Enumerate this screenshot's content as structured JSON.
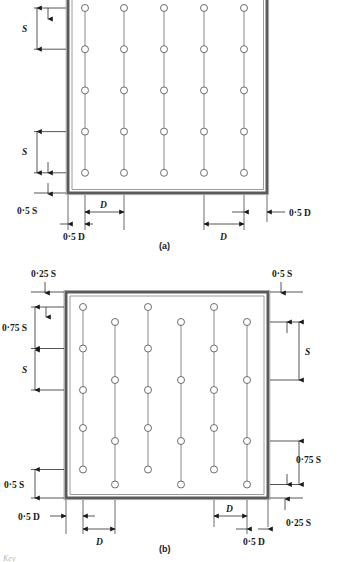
{
  "figure": {
    "type": "engineering-layout-diagram",
    "panels": [
      {
        "id": "a",
        "caption": "(a)",
        "pattern": "regular rectangular grid",
        "columns": 5,
        "rows": 5,
        "edge_dimensions": {
          "left_vertical_1": "S",
          "left_vertical_2": "S",
          "left_bottom": "0·5 S",
          "bottom_inner_left": "0·5 D",
          "bottom_upper_left": "D",
          "bottom_lower_right": "D",
          "bottom_right": "0·5 D"
        },
        "labels": [
          {
            "text": "S",
            "italic": true
          },
          {
            "text": "S",
            "italic": true
          },
          {
            "text": "0·5 S",
            "italic": false
          },
          {
            "text": "0·5 D",
            "italic": false
          },
          {
            "text": "D",
            "italic": true
          },
          {
            "text": "D",
            "italic": true
          },
          {
            "text": "0·5 D",
            "italic": false
          }
        ]
      },
      {
        "id": "b",
        "caption": "(b)",
        "pattern": "staggered / offset grid",
        "columns": 6,
        "rows_per_column": 5,
        "edge_dimensions": {
          "top_left": "0·25 S",
          "top_right": "0·5 S",
          "left_vertical_1": "0·75 S",
          "left_vertical_2": "S",
          "left_bottom": "0·5 S",
          "right_vertical_1": "S",
          "right_vertical_2": "0·75 S",
          "bottom_right_offset": "0·25 S",
          "bottom_left_outer": "0·5 D",
          "bottom_left_inner": "D",
          "bottom_right_inner": "D",
          "bottom_right_outer": "0·5 D"
        },
        "labels": [
          {
            "text": "0·25 S",
            "italic": false
          },
          {
            "text": "0·5 S",
            "italic": false
          },
          {
            "text": "0·75 S",
            "italic": false
          },
          {
            "text": "S",
            "italic": true
          },
          {
            "text": "0·5 S",
            "italic": false
          },
          {
            "text": "S",
            "italic": true
          },
          {
            "text": "0·75 S",
            "italic": false
          },
          {
            "text": "0·25 S",
            "italic": false
          },
          {
            "text": "0·5 D",
            "italic": false
          },
          {
            "text": "D",
            "italic": true
          },
          {
            "text": "D",
            "italic": true
          },
          {
            "text": "0·5 D",
            "italic": false
          }
        ]
      }
    ],
    "footer_fragment": "Key",
    "colors": {
      "ink": "#1a1a1a",
      "wall_outer": "#555555",
      "wall_inner": "#8a8a8a",
      "dim_line": "#333333",
      "hole_stroke": "#555555",
      "background": "#ffffff"
    },
    "symbols": {
      "hole": "circle-open",
      "riser": "vertical-line",
      "arrow": "filled-triangle-arrowhead"
    }
  },
  "panel_a": {
    "cap": "(a)",
    "s1": "S",
    "s2": "S",
    "half_s": "0·5 S",
    "half_d_left": "0·5 D",
    "d_top": "D",
    "d_bottom": "D",
    "half_d_right": "0·5 D"
  },
  "panel_b": {
    "cap": "(b)",
    "quarter_s_top": "0·25 S",
    "half_s_top": "0·5 S",
    "three_q_s_left": "0·75 S",
    "s_left": "S",
    "half_s_left": "0·5 S",
    "s_right": "S",
    "three_q_s_right": "0·75 S",
    "quarter_s_bottom": "0·25 S",
    "half_d_left": "0·5 D",
    "d_left": "D",
    "d_right": "D",
    "half_d_right": "0·5 D"
  },
  "footer": {
    "key": "Key"
  }
}
